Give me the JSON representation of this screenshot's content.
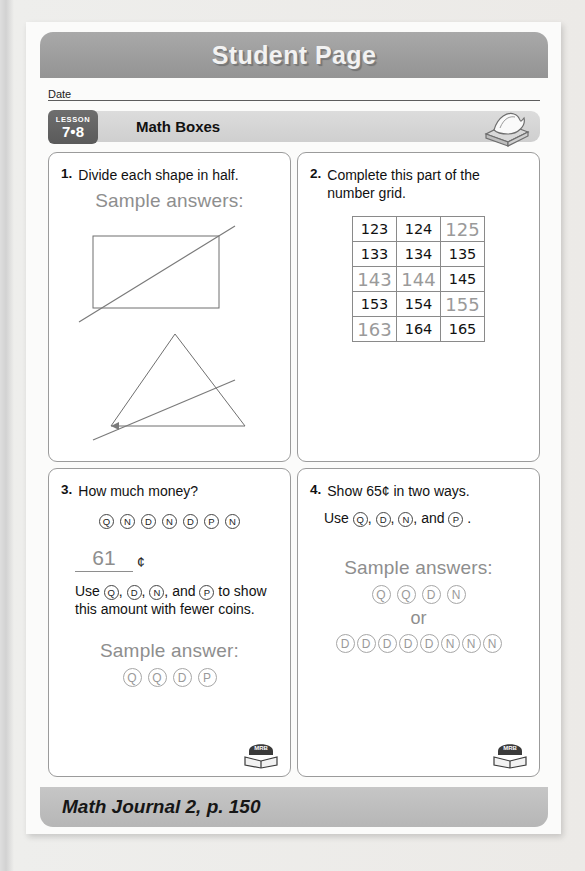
{
  "banner": {
    "title": "Student Page"
  },
  "date": {
    "label": "Date"
  },
  "lesson": {
    "word": "LESSON",
    "number": "7•8",
    "title": "Math Boxes",
    "icon": "journal-book-icon"
  },
  "problems": [
    {
      "number": "1.",
      "prompt": "Divide each shape in half.",
      "sample_label": "Sample answers:",
      "shapes": [
        "rectangle-with-diagonal",
        "triangle-with-bisecting-line"
      ]
    },
    {
      "number": "2.",
      "prompt": "Complete this part of the number grid.",
      "grid": {
        "rows": [
          [
            {
              "value": "123",
              "filled": false
            },
            {
              "value": "124",
              "filled": false
            },
            {
              "value": "125",
              "filled": true
            }
          ],
          [
            {
              "value": "133",
              "filled": false
            },
            {
              "value": "134",
              "filled": false
            },
            {
              "value": "135",
              "filled": false
            }
          ],
          [
            {
              "value": "143",
              "filled": true
            },
            {
              "value": "144",
              "filled": true
            },
            {
              "value": "145",
              "filled": false
            }
          ],
          [
            {
              "value": "153",
              "filled": false
            },
            {
              "value": "154",
              "filled": false
            },
            {
              "value": "155",
              "filled": true
            }
          ],
          [
            {
              "value": "163",
              "filled": true
            },
            {
              "value": "164",
              "filled": false
            },
            {
              "value": "165",
              "filled": false
            }
          ]
        ]
      }
    },
    {
      "number": "3.",
      "prompt": "How much money?",
      "coins": [
        "Q",
        "N",
        "D",
        "N",
        "D",
        "P",
        "N"
      ],
      "answer_value": "61",
      "cent_symbol": "¢",
      "instruction_prefix": "Use",
      "instruction_coins": [
        "Q",
        "D",
        "N",
        "P"
      ],
      "instruction_suffix": "to show this amount with fewer coins.",
      "sample_label": "Sample answer:",
      "sample_coins": [
        "Q",
        "Q",
        "D",
        "P"
      ],
      "mrb": {
        "label": "MRB",
        "pages": "88–89"
      }
    },
    {
      "number": "4.",
      "prompt": "Show 65¢ in two ways.",
      "instruction_prefix": "Use",
      "instruction_coins": [
        "Q",
        "D",
        "N",
        "P"
      ],
      "instruction_suffix": ".",
      "sample_label": "Sample answers:",
      "sample_coins_1": [
        "Q",
        "Q",
        "D",
        "N"
      ],
      "or_word": "or",
      "sample_coins_2": [
        "D",
        "D",
        "D",
        "D",
        "D",
        "N",
        "N",
        "N"
      ],
      "mrb": {
        "label": "MRB",
        "pages": "88–89"
      }
    }
  ],
  "footer": {
    "text": "Math Journal 2, p. 150"
  },
  "colors": {
    "banner_gray": "#9d9d9d",
    "footer_gray": "#bcbcbc",
    "answer_gray": "#8e8e8e",
    "ink_black": "#111111"
  }
}
